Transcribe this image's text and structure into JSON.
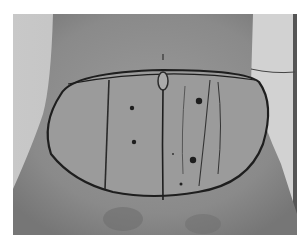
{
  "image": {
    "subject": "abdomen with surgical pre-operative markings",
    "colors": {
      "background": "#ffffff",
      "sheet": "#cfcfcf",
      "skin": "#8e8e8e",
      "skin_light": "#9c9c9c",
      "marker": "#1e1e1e"
    },
    "features": [
      "elliptical marked outline",
      "umbilicus at top of ellipse",
      "vertical midline marking",
      "parallel vertical marking lines",
      "dot markings"
    ]
  }
}
